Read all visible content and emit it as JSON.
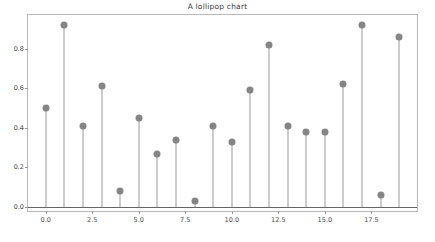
{
  "figure": {
    "title": "A lollipop chart",
    "background_color": "#ffffff",
    "frame_color": "#b8b8b8"
  },
  "chart_data": {
    "type": "scatter",
    "subtype": "lollipop-stem",
    "title": "A lollipop chart",
    "xlabel": "",
    "ylabel": "",
    "x": [
      0,
      1,
      2,
      3,
      4,
      5,
      6,
      7,
      8,
      9,
      10,
      11,
      12,
      13,
      14,
      15,
      16,
      17,
      18,
      19
    ],
    "values": [
      0.5,
      0.92,
      0.41,
      0.61,
      0.08,
      0.45,
      0.27,
      0.34,
      0.03,
      0.41,
      0.33,
      0.59,
      0.82,
      0.41,
      0.38,
      0.38,
      0.62,
      0.92,
      0.06,
      0.86
    ],
    "baseline": 0.0,
    "xlim": [
      -0.95,
      19.95
    ],
    "ylim": [
      -0.02,
      0.97
    ],
    "xticks": [
      0.0,
      2.5,
      5.0,
      7.5,
      10.0,
      12.5,
      15.0,
      17.5
    ],
    "xtick_labels": [
      "0.0",
      "2.5",
      "5.0",
      "7.5",
      "10.0",
      "12.5",
      "15.0",
      "17.5"
    ],
    "yticks": [
      0.0,
      0.2,
      0.4,
      0.6,
      0.8
    ],
    "ytick_labels": [
      "0.0",
      "0.2",
      "0.4",
      "0.6",
      "0.8"
    ],
    "grid": false,
    "legend": null,
    "marker_color": "#858585",
    "stem_color": "#9a9a9a",
    "baseline_color": "#666666",
    "marker_size": 7
  }
}
